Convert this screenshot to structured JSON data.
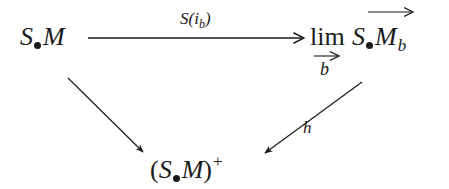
{
  "diagram": {
    "type": "commutative-diagram",
    "nodes": {
      "source": {
        "symbol": "S",
        "dot": "•",
        "object": "M",
        "latex": "S_\\bullet M"
      },
      "colimit": {
        "operator": "lim",
        "index_var": "b",
        "symbol": "S",
        "object": "M",
        "subscript": "b",
        "latex": "\\varinjlim_{b} \\overrightarrow{S_\\bullet M}_b"
      },
      "target": {
        "open_paren": "(",
        "symbol": "S",
        "object": "M",
        "close_paren": ")",
        "superscript": "+",
        "latex": "(S_\\bullet M)^+"
      }
    },
    "arrows": [
      {
        "from": "source",
        "to": "colimit",
        "label_main": "S(i",
        "label_sub": "b",
        "label_close": ")",
        "latex": "S(i_b)"
      },
      {
        "from": "source",
        "to": "target",
        "label_main": "",
        "latex": ""
      },
      {
        "from": "colimit",
        "to": "target",
        "label_main": "h",
        "latex": "h"
      }
    ],
    "colors": {
      "ink": "#1a1a1a",
      "background": "#ffffff"
    }
  }
}
